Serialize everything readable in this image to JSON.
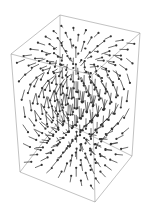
{
  "chart_data": {
    "type": "vector_field_3d",
    "title": "",
    "xlabel": "",
    "ylabel": "",
    "zlabel": "",
    "axes": false,
    "box": true,
    "source_point": [
      0,
      0,
      0.5
    ],
    "sink_point": [
      0,
      0,
      -0.5
    ],
    "grid": {
      "nx": 7,
      "ny": 7,
      "nz": 7
    },
    "arrow_color": "#333333",
    "box_color": "#999999",
    "box_corners_screen": {
      "top_back_left": [
        60,
        15
      ],
      "top_back_right": [
        140,
        33
      ],
      "top_front_left": [
        11,
        54
      ],
      "top_front_right": [
        92,
        75
      ],
      "bottom_back_left": [
        60,
        120
      ],
      "bottom_back_right": [
        132,
        156
      ],
      "bottom_front_left": [
        20,
        172
      ],
      "bottom_front_right": [
        95,
        202
      ]
    }
  }
}
